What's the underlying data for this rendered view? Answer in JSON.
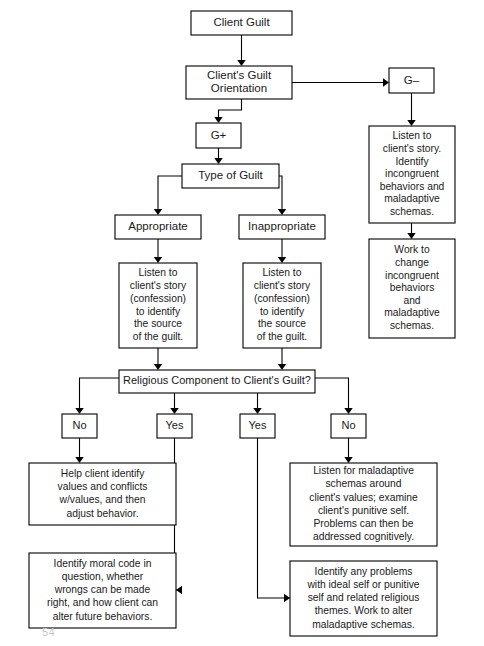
{
  "diagram": {
    "page_number": "54",
    "colors": {
      "box_fill": "#ffffff",
      "box_stroke": "#000000",
      "text": "#1a1a1a",
      "background": "#ffffff"
    }
  },
  "nodes": [
    {
      "id": "client-guilt",
      "name": "node-client-guilt",
      "lines": [
        "Client Guilt"
      ],
      "x": 191,
      "y": 11,
      "w": 101,
      "h": 24,
      "font_size": 11.5,
      "line_height": 13
    },
    {
      "id": "guilt-orientation",
      "name": "node-clients-guilt-orientation",
      "lines": [
        "Client's Guilt",
        "Orientation"
      ],
      "x": 186,
      "y": 66,
      "w": 106,
      "h": 33,
      "font_size": 11.5,
      "line_height": 13.5
    },
    {
      "id": "g-minus",
      "name": "node-g-minus",
      "lines": [
        "G–"
      ],
      "x": 389,
      "y": 68,
      "w": 45,
      "h": 25,
      "font_size": 11.5,
      "line_height": 13
    },
    {
      "id": "g-plus",
      "name": "node-g-plus",
      "lines": [
        "G+"
      ],
      "x": 196,
      "y": 123,
      "w": 45,
      "h": 25,
      "font_size": 11.5,
      "line_height": 13
    },
    {
      "id": "listen-incongruent",
      "name": "node-listen-identify-incongruent",
      "lines": [
        "Listen to",
        "client's story.",
        "Identify",
        "incongruent",
        "behaviors and",
        "maladaptive",
        "schemas."
      ],
      "x": 369,
      "y": 126,
      "w": 86,
      "h": 97,
      "font_size": 10.3,
      "line_height": 12.6
    },
    {
      "id": "work-to-change",
      "name": "node-work-to-change-incongruent",
      "lines": [
        "Work to",
        "change",
        "incongruent",
        "behaviors",
        "and",
        "maladaptive",
        "schemas."
      ],
      "x": 369,
      "y": 239,
      "w": 86,
      "h": 99,
      "font_size": 10.3,
      "line_height": 12.6
    },
    {
      "id": "type-of-guilt",
      "name": "node-type-of-guilt",
      "lines": [
        "Type of Guilt"
      ],
      "x": 182,
      "y": 164,
      "w": 97,
      "h": 24,
      "font_size": 11.5,
      "line_height": 13
    },
    {
      "id": "appropriate",
      "name": "node-appropriate",
      "lines": [
        "Appropriate"
      ],
      "x": 115,
      "y": 215,
      "w": 86,
      "h": 24,
      "font_size": 11.5,
      "line_height": 13
    },
    {
      "id": "inappropriate",
      "name": "node-inappropriate",
      "lines": [
        "Inappropriate"
      ],
      "x": 239,
      "y": 215,
      "w": 86,
      "h": 24,
      "font_size": 11.5,
      "line_height": 13
    },
    {
      "id": "listen-source-left",
      "name": "node-listen-source-of-guilt-appropriate",
      "lines": [
        "Listen to",
        "client's story",
        "(confession)",
        "to identify",
        "the source",
        "of the guilt."
      ],
      "x": 119,
      "y": 263,
      "w": 78,
      "h": 85,
      "font_size": 10.3,
      "line_height": 12.8
    },
    {
      "id": "listen-source-right",
      "name": "node-listen-source-of-guilt-inappropriate",
      "lines": [
        "Listen to",
        "client's story",
        "(confession)",
        "to identify",
        "the source",
        "of the guilt."
      ],
      "x": 243,
      "y": 263,
      "w": 78,
      "h": 85,
      "font_size": 10.3,
      "line_height": 12.8
    },
    {
      "id": "religious-component",
      "name": "node-religious-component-question",
      "lines": [
        "Religious Component to Client's Guilt?"
      ],
      "x": 119,
      "y": 370,
      "w": 196,
      "h": 23,
      "font_size": 11.0,
      "line_height": 13
    },
    {
      "id": "no-1",
      "name": "node-answer-no-left",
      "lines": [
        "No"
      ],
      "x": 62,
      "y": 414,
      "w": 35,
      "h": 24,
      "font_size": 11.0,
      "line_height": 13
    },
    {
      "id": "yes-1",
      "name": "node-answer-yes-left",
      "lines": [
        "Yes"
      ],
      "x": 157,
      "y": 414,
      "w": 35,
      "h": 24,
      "font_size": 11.0,
      "line_height": 13
    },
    {
      "id": "yes-2",
      "name": "node-answer-yes-right",
      "lines": [
        "Yes"
      ],
      "x": 240,
      "y": 414,
      "w": 35,
      "h": 24,
      "font_size": 11.0,
      "line_height": 13
    },
    {
      "id": "no-2",
      "name": "node-answer-no-right",
      "lines": [
        "No"
      ],
      "x": 331,
      "y": 414,
      "w": 35,
      "h": 24,
      "font_size": 11.0,
      "line_height": 13
    },
    {
      "id": "help-client-identify",
      "name": "node-help-client-identify-values",
      "lines": [
        "Help client identify",
        "values and conflicts",
        "w/values, and then",
        "adjust behavior."
      ],
      "x": 29,
      "y": 463,
      "w": 147,
      "h": 62,
      "font_size": 10.3,
      "line_height": 13.2
    },
    {
      "id": "identify-moral-code",
      "name": "node-identify-moral-code",
      "lines": [
        "Identify moral code in",
        "question, whether",
        "wrongs can be made",
        "right, and how client can",
        "alter future behaviors."
      ],
      "x": 29,
      "y": 553,
      "w": 147,
      "h": 75,
      "font_size": 10.3,
      "line_height": 13.2
    },
    {
      "id": "listen-maladaptive-values",
      "name": "node-listen-maladaptive-schemas-values",
      "lines": [
        "Listen for maladaptive",
        "schemas around",
        "client's values; examine",
        "client's punitive self.",
        "Problems can then be",
        "addressed cognitively."
      ],
      "x": 290,
      "y": 463,
      "w": 147,
      "h": 83,
      "font_size": 10.3,
      "line_height": 13.2
    },
    {
      "id": "identify-ideal-self",
      "name": "node-identify-ideal-self-problems",
      "lines": [
        "Identify any problems",
        "with ideal self or punitive",
        "self and related religious",
        "themes. Work to alter",
        "maladaptive schemas."
      ],
      "x": 290,
      "y": 561,
      "w": 147,
      "h": 75,
      "font_size": 10.3,
      "line_height": 13.2
    }
  ],
  "connectors": [
    {
      "name": "conn-client-guilt-to-orientation",
      "d": "M 241.5 35 L 241.5 62",
      "arrow": "down",
      "ax": 241.5,
      "ay": 66
    },
    {
      "name": "conn-orientation-to-g-minus",
      "d": "M 292 82.5 L 383 82.5",
      "arrow": "right",
      "ax": 389,
      "ay": 82.5
    },
    {
      "name": "conn-orientation-to-g-plus",
      "d": "M 241.5 99 L 241.5 110 L 218.5 110 L 218.5 119",
      "arrow": "down",
      "ax": 218.5,
      "ay": 123
    },
    {
      "name": "conn-g-minus-to-listen",
      "d": "M 411.5 93 L 411.5 122",
      "arrow": "down",
      "ax": 411.5,
      "ay": 126
    },
    {
      "name": "conn-listen-to-work-change",
      "d": "M 411.5 223 L 411.5 235",
      "arrow": "down",
      "ax": 411.5,
      "ay": 239
    },
    {
      "name": "conn-g-plus-to-type",
      "d": "M 218.5 148 L 218.5 160",
      "arrow": "down",
      "ax": 218.5,
      "ay": 164
    },
    {
      "name": "conn-type-to-appropriate",
      "d": "M 182 176 L 158 176 L 158 211",
      "arrow": "down",
      "ax": 158,
      "ay": 215
    },
    {
      "name": "conn-type-to-inappropriate",
      "d": "M 279 176 L 282 176 L 282 211",
      "arrow": "down",
      "ax": 282,
      "ay": 215
    },
    {
      "name": "conn-appropriate-to-listen-left",
      "d": "M 158 239 L 158 259",
      "arrow": "down",
      "ax": 158,
      "ay": 263
    },
    {
      "name": "conn-inappropriate-to-listen-right",
      "d": "M 282 239 L 282 259",
      "arrow": "down",
      "ax": 282,
      "ay": 263
    },
    {
      "name": "conn-listen-left-to-religious",
      "d": "M 158 348 L 158 366",
      "arrow": "down",
      "ax": 158,
      "ay": 370
    },
    {
      "name": "conn-listen-right-to-religious",
      "d": "M 282 348 L 282 366",
      "arrow": "down",
      "ax": 282,
      "ay": 370
    },
    {
      "name": "conn-religious-to-no-1",
      "d": "M 119 378 L 79.5 378 L 79.5 410",
      "arrow": "down",
      "ax": 79.5,
      "ay": 414
    },
    {
      "name": "conn-religious-to-yes-1",
      "d": "M 174.5 393 L 174.5 410",
      "arrow": "down",
      "ax": 174.5,
      "ay": 414
    },
    {
      "name": "conn-religious-to-yes-2",
      "d": "M 257.5 393 L 257.5 410",
      "arrow": "down",
      "ax": 257.5,
      "ay": 414
    },
    {
      "name": "conn-religious-to-no-2",
      "d": "M 315 378 L 348.5 378 L 348.5 410",
      "arrow": "down",
      "ax": 348.5,
      "ay": 414
    },
    {
      "name": "conn-no-1-to-help-client",
      "d": "M 79.5 438 L 79.5 459",
      "arrow": "down",
      "ax": 79.5,
      "ay": 463
    },
    {
      "name": "conn-yes-1-to-identify-moral",
      "d": "M 174.5 438 L 174.5 590 L 182 590",
      "arrow": "left",
      "ax": 176,
      "ay": 590
    },
    {
      "name": "conn-yes-2-to-identify-ideal",
      "d": "M 257.5 438 L 257.5 598 L 296 598",
      "arrow": "right",
      "ax": 290,
      "ay": 598
    },
    {
      "name": "conn-no-2-to-listen-maladaptive",
      "d": "M 348.5 438 L 348.5 459",
      "arrow": "down",
      "ax": 348.5,
      "ay": 463
    }
  ]
}
